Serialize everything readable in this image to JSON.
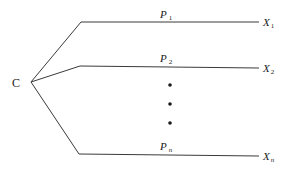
{
  "diagram": {
    "type": "branching-tree",
    "root": {
      "label": "C",
      "x": 31,
      "y": 82
    },
    "branches": [
      {
        "id": "branch-1",
        "edge_label": "P",
        "edge_sub": "1",
        "leaf_label": "X",
        "leaf_sub": "1",
        "elbow": [
          81,
          22
        ],
        "end": [
          259,
          22
        ],
        "label_pos": [
          160,
          18
        ],
        "leaf_pos": [
          263,
          26
        ]
      },
      {
        "id": "branch-2",
        "edge_label": "P",
        "edge_sub": "2",
        "leaf_label": "X",
        "leaf_sub": "2",
        "elbow": [
          80,
          66
        ],
        "end": [
          259,
          68
        ],
        "label_pos": [
          160,
          62
        ],
        "leaf_pos": [
          263,
          72
        ]
      },
      {
        "id": "branch-n",
        "edge_label": "P",
        "edge_sub": "n",
        "leaf_label": "X",
        "leaf_sub": "n",
        "elbow": [
          79,
          154
        ],
        "end": [
          259,
          156
        ],
        "label_pos": [
          160,
          150
        ],
        "leaf_pos": [
          263,
          160
        ]
      }
    ],
    "ellipsis_dots": [
      [
        170,
        85
      ],
      [
        170,
        104
      ],
      [
        170,
        123
      ]
    ],
    "colors": {
      "line": "#3a3a3a",
      "text": "#1a1a1a",
      "background": "#ffffff"
    }
  }
}
